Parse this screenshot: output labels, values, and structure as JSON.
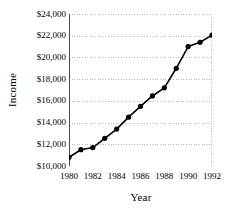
{
  "chart_data": {
    "type": "line",
    "title": "",
    "xlabel": "Year",
    "ylabel": "Income",
    "x": [
      1980,
      1981,
      1982,
      1983,
      1984,
      1985,
      1986,
      1987,
      1988,
      1989,
      1990,
      1991,
      1992
    ],
    "values": [
      10800,
      11500,
      11700,
      12550,
      13400,
      14500,
      15500,
      16450,
      17200,
      19000,
      21000,
      21400,
      22050
    ],
    "series": [
      {
        "name": "Income",
        "values": [
          10800,
          11500,
          11700,
          12550,
          13400,
          14500,
          15500,
          16450,
          17200,
          19000,
          21000,
          21400,
          22050
        ]
      }
    ],
    "xlim": [
      1980,
      1992
    ],
    "ylim": [
      10000,
      24000
    ],
    "y_ticks": [
      10000,
      12000,
      14000,
      16000,
      18000,
      20000,
      22000,
      24000
    ],
    "y_tick_labels": [
      "$10,000",
      "$12,000",
      "$14,000",
      "$16,000",
      "$18,000",
      "$20,000",
      "$22,000",
      "$24,000"
    ],
    "x_ticks": [
      1980,
      1981,
      1982,
      1983,
      1984,
      1985,
      1986,
      1987,
      1988,
      1989,
      1990,
      1991,
      1992
    ],
    "x_tick_labels_shown": [
      "1980",
      "1982",
      "1984",
      "1986",
      "1988",
      "1990",
      "1992"
    ],
    "x_tick_label_values": [
      1980,
      1982,
      1984,
      1986,
      1988,
      1990,
      1992
    ],
    "grid": "horizontal-dotted",
    "legend": "none",
    "marker": "filled-circle",
    "line_color": "#000000",
    "marker_color": "#000000",
    "grid_color": "#b8b8b8",
    "axis_color": "#4a4a4a",
    "background": "#ffffff"
  }
}
